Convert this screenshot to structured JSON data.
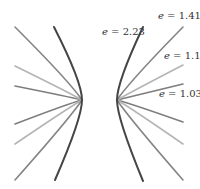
{
  "diagram": {
    "curves": [
      {
        "eccentricity": "2.23",
        "label": "e = 2.23",
        "color": "#444444",
        "width": 2.0
      },
      {
        "eccentricity": "1.41",
        "label": "e = 1.41",
        "color": "#7a7a7a",
        "width": 1.6
      },
      {
        "eccentricity": "1.1",
        "label": "e = 1.1",
        "color": "#b0b0b0",
        "width": 1.6
      },
      {
        "eccentricity": "1.03",
        "label": "e = 1.03",
        "color": "#7a7a7a",
        "width": 1.6
      }
    ],
    "labels": {
      "e_symbol": "e",
      "l0": {
        "prefix": "e",
        "value": " = 2.23"
      },
      "l1": {
        "prefix": "e",
        "value": " = 1.41"
      },
      "l2": {
        "prefix": "e",
        "value": " = 1.1"
      },
      "l3": {
        "prefix": "e",
        "value": " = 1.03"
      }
    }
  }
}
